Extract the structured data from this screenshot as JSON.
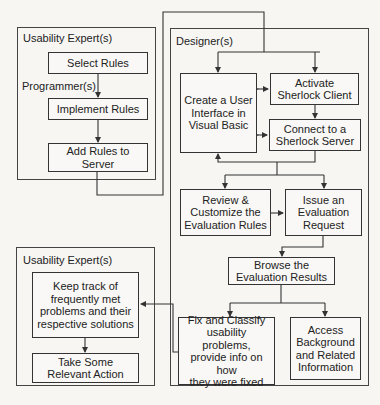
{
  "panels": {
    "usability_top": {
      "label": "Usability Expert(s)"
    },
    "programmer": {
      "label": "Programmer(s)"
    },
    "designer": {
      "label": "Designer(s)"
    },
    "usability_bottom": {
      "label": "Usability Expert(s)"
    }
  },
  "boxes": {
    "select_rules": "Select Rules",
    "implement_rules": "Implement Rules",
    "add_rules": "Add Rules to\nServer",
    "create_ui": "Create a User\nInterface in\nVisual Basic",
    "activate_client": "Activate\nSherlock Client",
    "connect_server": "Connect to a\nSherlock Server",
    "review_rules": "Review &\nCustomize the\nEvaluation Rules",
    "issue_request": "Issue an\nEvaluation\nRequest",
    "browse_results": "Browse the\nEvaluation Results",
    "fix_classify": "Fix and Classify\nusability problems,\nprovide info on how\nthey were fixed",
    "access_background": "Access\nBackground\nand Related\nInformation",
    "keep_track": "Keep track of\nfrequently met\nproblems and their\nrespective solutions",
    "take_action": "Take Some\nRelevant Action"
  },
  "colors": {
    "line": "#333333",
    "background": "#f7f6f3"
  }
}
